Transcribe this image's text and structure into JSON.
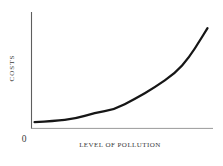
{
  "figure": {
    "background": "#ffffff",
    "origin_label": "0",
    "axis_color": "#5e5e5e",
    "x_axis_color": "#9a9a9a",
    "curve_color": "#161616",
    "text_color": "#3a3a3a"
  },
  "chart_data": {
    "type": "line",
    "title": "",
    "xlabel": "LEVEL OF POLLUTION",
    "ylabel": "COSTS",
    "x_range": [
      0,
      1
    ],
    "y_range": [
      0,
      1
    ],
    "grid": false,
    "legend": null,
    "axis_ticks": {
      "x": [],
      "y": [],
      "origin": "0"
    },
    "series": [
      {
        "name": "cost-of-pollution-curve",
        "x": [
          0.02,
          0.13,
          0.24,
          0.35,
          0.46,
          0.57,
          0.68,
          0.79,
          0.87,
          0.93,
          0.97
        ],
        "y": [
          0.05,
          0.06,
          0.08,
          0.13,
          0.16,
          0.25,
          0.35,
          0.47,
          0.61,
          0.76,
          0.86
        ]
      }
    ]
  }
}
